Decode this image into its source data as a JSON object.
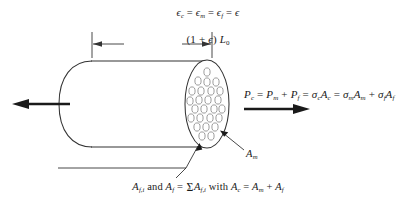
{
  "figure": {
    "strain_equation": {
      "parts": [
        {
          "sym": "ϵ",
          "sub": "c"
        },
        {
          "op": "="
        },
        {
          "sym": "ϵ",
          "sub": "m"
        },
        {
          "op": "="
        },
        {
          "sym": "ϵ",
          "sub": "f"
        },
        {
          "op": "="
        },
        {
          "sym": "ϵ",
          "sub": ""
        }
      ],
      "plain": "ϵc = ϵm = ϵf = ϵ"
    },
    "length_label": {
      "prefix": "(1 + ",
      "epsilon": "ϵ",
      "middle": ") ",
      "symbol": "L",
      "subscript": "0",
      "plain": "(1 + ϵ) L0"
    },
    "force_equation": {
      "plain": "Pc = Pm + Pf = σcAc = σmAm + σfAf",
      "terms": [
        {
          "sym": "P",
          "sub": "c"
        },
        {
          "sym": "P",
          "sub": "m"
        },
        {
          "sym": "P",
          "sub": "f"
        },
        {
          "sym": "σ",
          "sub": "c"
        },
        {
          "sym": "A",
          "sub": "c"
        },
        {
          "sym": "σ",
          "sub": "m"
        },
        {
          "sym": "A",
          "sub": "m"
        },
        {
          "sym": "σ",
          "sub": "f"
        },
        {
          "sym": "A",
          "sub": "f"
        }
      ]
    },
    "matrix_area_label": {
      "symbol": "A",
      "subscript": "m",
      "plain": "Am"
    },
    "fiber_caption": {
      "plain": "Af,i and Af = Σi Af,i with Ac = Am + Af",
      "sum_index": "i"
    },
    "load_arrows": {
      "left_direction": "left",
      "right_direction": "right"
    },
    "fiber_count": 25,
    "colors": {
      "ink": "#1a1a1a",
      "outline": "#333333",
      "fiber_stroke": "#8a8a8a",
      "background": "#ffffff"
    }
  }
}
